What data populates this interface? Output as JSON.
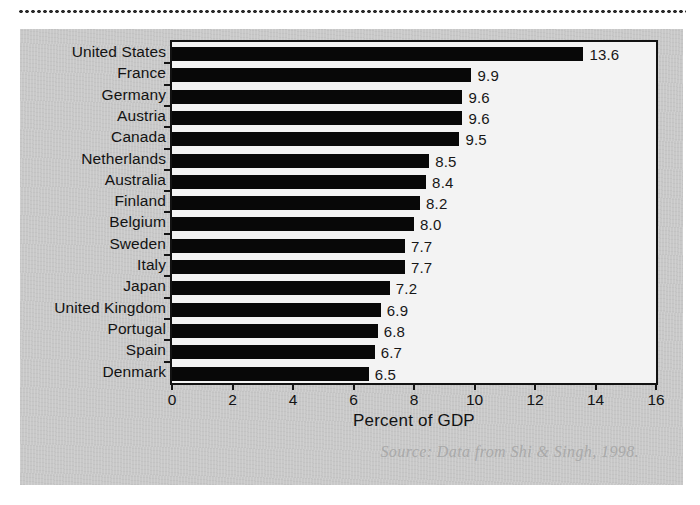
{
  "figure": {
    "source_note": "Source: Data from Shi & Singh, 1998.",
    "panel_color": "#c8c8c8",
    "plot_background": "#f3f3f3",
    "bar_color": "#080808"
  },
  "chart_data": {
    "type": "bar",
    "orientation": "horizontal",
    "title": "",
    "xlabel": "Percent of GDP",
    "ylabel": "",
    "xlim": [
      0,
      16
    ],
    "xticks": [
      0,
      2,
      4,
      6,
      8,
      10,
      12,
      14,
      16
    ],
    "xtick_labels": [
      "0",
      "2",
      "4",
      "6",
      "8",
      "10",
      "12",
      "14",
      "16"
    ],
    "grid": false,
    "legend": "none",
    "categories": [
      "United States",
      "France",
      "Germany",
      "Austria",
      "Canada",
      "Netherlands",
      "Australia",
      "Finland",
      "Belgium",
      "Sweden",
      "Italy",
      "Japan",
      "United Kingdom",
      "Portugal",
      "Spain",
      "Denmark"
    ],
    "values": [
      13.6,
      9.9,
      9.6,
      9.6,
      9.5,
      8.5,
      8.4,
      8.2,
      8.0,
      7.7,
      7.7,
      7.2,
      6.9,
      6.8,
      6.7,
      6.5
    ],
    "value_labels": [
      "13.6",
      "9.9",
      "9.6",
      "9.6",
      "9.5",
      "8.5",
      "8.4",
      "8.2",
      "8.0",
      "7.7",
      "7.7",
      "7.2",
      "6.9",
      "6.8",
      "6.7",
      "6.5"
    ]
  }
}
